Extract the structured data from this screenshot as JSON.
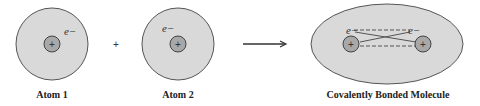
{
  "diagram": {
    "colors": {
      "cloud_fill": "#d9d9d9",
      "cloud_stroke": "#555555",
      "nucleus_fill": "#a8a8a8",
      "line": "#555555",
      "text": "#222222"
    },
    "atom1": {
      "label": "Atom 1",
      "nucleus_symbol": "+",
      "electron_label": "e−"
    },
    "operator": "+",
    "atom2": {
      "label": "Atom 2",
      "nucleus_symbol": "+",
      "electron_label": "e−"
    },
    "arrow": "reaction-arrow",
    "molecule": {
      "label": "Covalently Bonded Molecule",
      "nucleus_symbol": "+",
      "electron_labels": [
        "e−",
        "e−"
      ]
    }
  }
}
